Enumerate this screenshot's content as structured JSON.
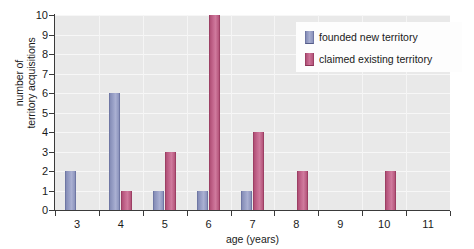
{
  "chart_data": {
    "type": "bar",
    "title": "",
    "xlabel": "age (years)",
    "ylabel_lines": [
      "number of",
      "territory acquisitions"
    ],
    "ylabel": "number of territory acquisitions",
    "categories": [
      "3",
      "4",
      "5",
      "6",
      "7",
      "8",
      "9",
      "10",
      "11"
    ],
    "series": [
      {
        "name": "founded new territory",
        "color": "#9ba2c8",
        "values": [
          2,
          6,
          1,
          1,
          1,
          0,
          0,
          0,
          0
        ]
      },
      {
        "name": "claimed existing territory",
        "color": "#c66a90",
        "values": [
          0,
          1,
          3,
          10,
          4,
          2,
          0,
          2,
          0
        ]
      }
    ],
    "ylim": [
      0,
      10
    ],
    "yticks": [
      0,
      1,
      2,
      3,
      4,
      5,
      6,
      7,
      8,
      9,
      10
    ],
    "ytick_labels": [
      "0",
      "1",
      "2",
      "3",
      "4",
      "5",
      "6",
      "7",
      "8",
      "9",
      "10"
    ],
    "grid": true,
    "grid_color": "#f7f7f7",
    "plot_background": "#e9e9e9",
    "legend_position": "top-right",
    "legend_entries": [
      "founded new territory",
      "claimed existing territory"
    ]
  }
}
